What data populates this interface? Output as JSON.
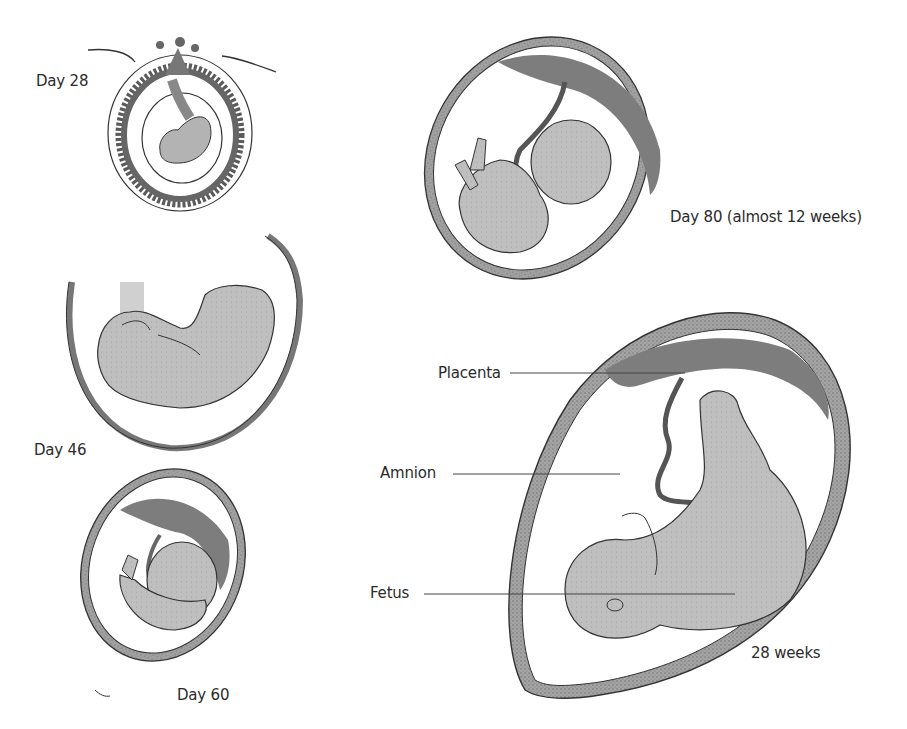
{
  "figure": {
    "stages": [
      {
        "id": "day28",
        "label": "Day 28"
      },
      {
        "id": "day46",
        "label": "Day 46"
      },
      {
        "id": "day60",
        "label": "Day 60"
      },
      {
        "id": "day80",
        "label": "Day 80 (almost 12 weeks)"
      },
      {
        "id": "week28",
        "label": "28 weeks"
      }
    ],
    "annotations": [
      {
        "id": "placenta",
        "label": "Placenta"
      },
      {
        "id": "amnion",
        "label": "Amnion"
      },
      {
        "id": "fetus",
        "label": "Fetus"
      }
    ],
    "colors": {
      "wall_fill": "#9a9a9a",
      "wall_stroke": "#333333",
      "placenta": "#7d7d7d",
      "fetus_fill": "#bdbdbd",
      "outline": "#2a2a2a",
      "leader_line": "#444444",
      "text": "#2b2b2b"
    }
  }
}
